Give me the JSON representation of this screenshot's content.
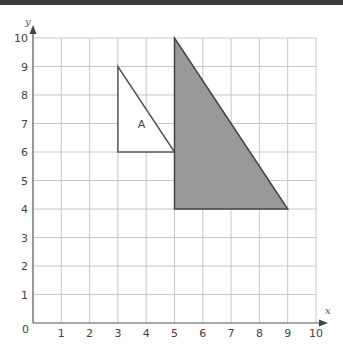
{
  "chart_data": {
    "type": "diagram",
    "title": "",
    "xlabel": "x",
    "ylabel": "y",
    "xlim": [
      0,
      10
    ],
    "ylim": [
      0,
      10
    ],
    "grid": true,
    "x_ticks": [
      "1",
      "2",
      "3",
      "4",
      "5",
      "6",
      "7",
      "8",
      "9",
      "10"
    ],
    "y_ticks": [
      "1",
      "2",
      "3",
      "4",
      "5",
      "6",
      "7",
      "8",
      "9",
      "10"
    ],
    "origin_label": "0",
    "shapes": [
      {
        "name": "A",
        "label": "A",
        "vertices": [
          [
            3,
            9
          ],
          [
            3,
            6
          ],
          [
            5,
            6
          ]
        ],
        "fill": "#ffffff",
        "stroke": "#555555",
        "label_pos": [
          3.7,
          7
        ]
      },
      {
        "name": "image",
        "label": "",
        "vertices": [
          [
            5,
            10
          ],
          [
            5,
            4
          ],
          [
            9,
            4
          ]
        ],
        "fill": "#999999",
        "stroke": "#444444"
      }
    ]
  },
  "colors": {
    "grid": "#c8c8c8",
    "axis": "#555555",
    "shaded": "#999999",
    "topbar": "#3a3a3a"
  }
}
